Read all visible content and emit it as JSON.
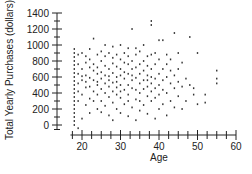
{
  "chart_data": {
    "type": "scatter",
    "title": "",
    "xlabel": "Age",
    "ylabel": "Total Yearly Purchases (dollars)",
    "xlim": [
      17,
      61
    ],
    "ylim": [
      -50,
      1450
    ],
    "xticks": [
      20,
      30,
      40,
      50,
      60
    ],
    "yticks": [
      0,
      200,
      400,
      600,
      800,
      1000,
      1200,
      1400
    ],
    "x_minor_step": 2.5,
    "y_minor_step": 100,
    "grid": false,
    "legend": null,
    "marker_color": "#333333",
    "points": [
      [
        18,
        0
      ],
      [
        18,
        50
      ],
      [
        18,
        100
      ],
      [
        18,
        150
      ],
      [
        18,
        200
      ],
      [
        18,
        250
      ],
      [
        18,
        300
      ],
      [
        18,
        350
      ],
      [
        18,
        400
      ],
      [
        18,
        450
      ],
      [
        18,
        500
      ],
      [
        18,
        550
      ],
      [
        18,
        600
      ],
      [
        18,
        650
      ],
      [
        18,
        700
      ],
      [
        18,
        750
      ],
      [
        18,
        800
      ],
      [
        18,
        850
      ],
      [
        18,
        900
      ],
      [
        18,
        950
      ],
      [
        19,
        300
      ],
      [
        19,
        520
      ],
      [
        19,
        640
      ],
      [
        19,
        760
      ],
      [
        19,
        880
      ],
      [
        19,
        420
      ],
      [
        19,
        -40
      ],
      [
        20,
        80
      ],
      [
        20,
        380
      ],
      [
        20,
        560
      ],
      [
        20,
        700
      ],
      [
        20,
        900
      ],
      [
        20,
        610
      ],
      [
        21,
        250
      ],
      [
        21,
        470
      ],
      [
        21,
        620
      ],
      [
        21,
        780
      ],
      [
        21,
        860
      ],
      [
        21,
        540
      ],
      [
        22,
        150
      ],
      [
        22,
        330
      ],
      [
        22,
        480
      ],
      [
        22,
        590
      ],
      [
        22,
        720
      ],
      [
        22,
        820
      ],
      [
        22,
        950
      ],
      [
        23,
        420
      ],
      [
        23,
        560
      ],
      [
        23,
        680
      ],
      [
        23,
        760
      ],
      [
        23,
        1080
      ],
      [
        23,
        300
      ],
      [
        24,
        200
      ],
      [
        24,
        380
      ],
      [
        24,
        500
      ],
      [
        24,
        640
      ],
      [
        24,
        720
      ],
      [
        24,
        880
      ],
      [
        24,
        540
      ],
      [
        25,
        160
      ],
      [
        25,
        300
      ],
      [
        25,
        450
      ],
      [
        25,
        580
      ],
      [
        25,
        660
      ],
      [
        25,
        800
      ],
      [
        25,
        920
      ],
      [
        26,
        240
      ],
      [
        26,
        400
      ],
      [
        26,
        520
      ],
      [
        26,
        620
      ],
      [
        26,
        740
      ],
      [
        26,
        860
      ],
      [
        26,
        1000
      ],
      [
        27,
        120
      ],
      [
        27,
        350
      ],
      [
        27,
        480
      ],
      [
        27,
        560
      ],
      [
        27,
        700
      ],
      [
        27,
        900
      ],
      [
        27,
        610
      ],
      [
        28,
        280
      ],
      [
        28,
        420
      ],
      [
        28,
        530
      ],
      [
        28,
        650
      ],
      [
        28,
        770
      ],
      [
        28,
        840
      ],
      [
        28,
        980
      ],
      [
        28,
        60
      ],
      [
        29,
        200
      ],
      [
        29,
        380
      ],
      [
        29,
        470
      ],
      [
        29,
        600
      ],
      [
        29,
        730
      ],
      [
        29,
        880
      ],
      [
        29,
        540
      ],
      [
        30,
        150
      ],
      [
        30,
        340
      ],
      [
        30,
        500
      ],
      [
        30,
        620
      ],
      [
        30,
        700
      ],
      [
        30,
        820
      ],
      [
        30,
        1000
      ],
      [
        30,
        420
      ],
      [
        31,
        260
      ],
      [
        31,
        440
      ],
      [
        31,
        580
      ],
      [
        31,
        660
      ],
      [
        31,
        780
      ],
      [
        31,
        900
      ],
      [
        32,
        110
      ],
      [
        32,
        380
      ],
      [
        32,
        500
      ],
      [
        32,
        640
      ],
      [
        32,
        760
      ],
      [
        32,
        860
      ],
      [
        32,
        960
      ],
      [
        32,
        300
      ],
      [
        33,
        220
      ],
      [
        33,
        460
      ],
      [
        33,
        560
      ],
      [
        33,
        700
      ],
      [
        33,
        800
      ],
      [
        33,
        1200
      ],
      [
        33,
        620
      ],
      [
        34,
        60
      ],
      [
        34,
        320
      ],
      [
        34,
        440
      ],
      [
        34,
        590
      ],
      [
        34,
        720
      ],
      [
        34,
        880
      ],
      [
        34,
        960
      ],
      [
        35,
        180
      ],
      [
        35,
        400
      ],
      [
        35,
        520
      ],
      [
        35,
        640
      ],
      [
        35,
        760
      ],
      [
        35,
        920
      ],
      [
        35,
        300
      ],
      [
        36,
        250
      ],
      [
        36,
        450
      ],
      [
        36,
        560
      ],
      [
        36,
        680
      ],
      [
        36,
        800
      ],
      [
        36,
        1000
      ],
      [
        37,
        140
      ],
      [
        37,
        360
      ],
      [
        37,
        480
      ],
      [
        37,
        620
      ],
      [
        37,
        740
      ],
      [
        37,
        860
      ],
      [
        37,
        560
      ],
      [
        38,
        300
      ],
      [
        38,
        420
      ],
      [
        38,
        520
      ],
      [
        38,
        700
      ],
      [
        38,
        880
      ],
      [
        38,
        1250
      ],
      [
        38,
        1300
      ],
      [
        38,
        600
      ],
      [
        39,
        80
      ],
      [
        39,
        340
      ],
      [
        39,
        460
      ],
      [
        39,
        580
      ],
      [
        39,
        760
      ],
      [
        39,
        900
      ],
      [
        40,
        200
      ],
      [
        40,
        380
      ],
      [
        40,
        500
      ],
      [
        40,
        640
      ],
      [
        40,
        820
      ],
      [
        40,
        1060
      ],
      [
        41,
        260
      ],
      [
        41,
        440
      ],
      [
        41,
        560
      ],
      [
        41,
        700
      ],
      [
        41,
        1060
      ],
      [
        42,
        120
      ],
      [
        42,
        400
      ],
      [
        42,
        600
      ],
      [
        42,
        760
      ],
      [
        42,
        880
      ],
      [
        43,
        300
      ],
      [
        43,
        520
      ],
      [
        43,
        680
      ],
      [
        43,
        820
      ],
      [
        44,
        220
      ],
      [
        44,
        460
      ],
      [
        44,
        620
      ],
      [
        44,
        1150
      ],
      [
        45,
        360
      ],
      [
        45,
        540
      ],
      [
        45,
        700
      ],
      [
        45,
        900
      ],
      [
        46,
        200
      ],
      [
        46,
        480
      ],
      [
        46,
        780
      ],
      [
        47,
        580
      ],
      [
        47,
        300
      ],
      [
        48,
        1100
      ],
      [
        48,
        500
      ],
      [
        49,
        460
      ],
      [
        49,
        380
      ],
      [
        50,
        900
      ],
      [
        50,
        260
      ],
      [
        52,
        280
      ],
      [
        52,
        380
      ],
      [
        55,
        580
      ],
      [
        55,
        520
      ],
      [
        55,
        680
      ]
    ]
  },
  "axes": {
    "x_label": "Age",
    "y_label": "Total Yearly Purchases (dollars)",
    "x_tick_labels": [
      "20",
      "30",
      "40",
      "50",
      "60"
    ],
    "y_tick_labels": [
      "1400",
      "1200",
      "1000",
      "800",
      "600",
      "400",
      "200",
      "0"
    ]
  }
}
